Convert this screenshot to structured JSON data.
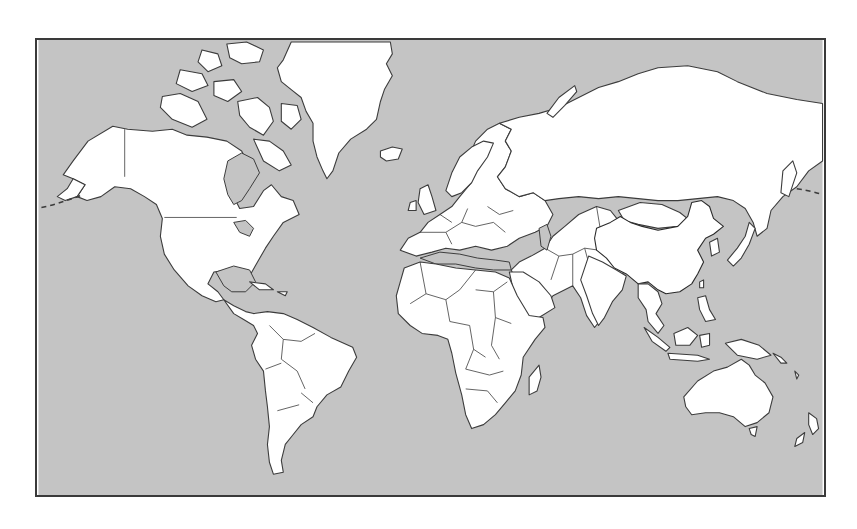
{
  "map": {
    "title": "World map with China highlighted",
    "projection": "mercator",
    "highlighted_country": "China",
    "colors": {
      "ocean": "#c4c4c4",
      "land": "#ffffff",
      "highlight": "#4a4a4a",
      "border": "#3c3c3c"
    },
    "regions": [
      {
        "name": "North America"
      },
      {
        "name": "Greenland"
      },
      {
        "name": "South America"
      },
      {
        "name": "Europe"
      },
      {
        "name": "Africa"
      },
      {
        "name": "Russia"
      },
      {
        "name": "Asia"
      },
      {
        "name": "China",
        "highlighted": true
      },
      {
        "name": "Australia"
      },
      {
        "name": "New Zealand"
      }
    ]
  }
}
